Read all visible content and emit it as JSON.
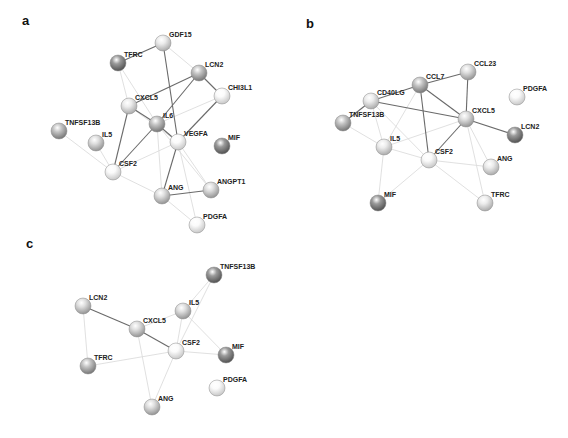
{
  "figure": {
    "panels": [
      {
        "label": "a",
        "label_pos": [
          22,
          25
        ],
        "nodes": [
          {
            "id": "GDF15",
            "x": 163,
            "y": 43,
            "shade": "light"
          },
          {
            "id": "TFRC",
            "x": 118,
            "y": 63,
            "shade": "dark"
          },
          {
            "id": "LCN2",
            "x": 199,
            "y": 73,
            "shade": "medium-dark"
          },
          {
            "id": "CHI3L1",
            "x": 222,
            "y": 96,
            "shade": "lighter"
          },
          {
            "id": "CXCL5",
            "x": 129,
            "y": 106,
            "shade": "light"
          },
          {
            "id": "IL6",
            "x": 157,
            "y": 124,
            "shade": "medium-dark"
          },
          {
            "id": "VEGFA",
            "x": 178,
            "y": 142,
            "shade": "lighter"
          },
          {
            "id": "TNFSF13B",
            "x": 59,
            "y": 131,
            "shade": "medium-dark"
          },
          {
            "id": "IL5",
            "x": 96,
            "y": 143,
            "shade": "medium"
          },
          {
            "id": "MIF",
            "x": 222,
            "y": 146,
            "shade": "dark"
          },
          {
            "id": "CSF2",
            "x": 113,
            "y": 172,
            "shade": "lighter"
          },
          {
            "id": "ANG",
            "x": 162,
            "y": 196,
            "shade": "medium"
          },
          {
            "id": "ANGPT1",
            "x": 211,
            "y": 190,
            "shade": "medium"
          },
          {
            "id": "PDGFA",
            "x": 197,
            "y": 225,
            "shade": "lighter"
          }
        ],
        "strong_edges": [
          [
            "TFRC",
            "GDF15"
          ],
          [
            "GDF15",
            "VEGFA"
          ],
          [
            "CXCL5",
            "LCN2"
          ],
          [
            "LCN2",
            "IL6"
          ],
          [
            "LCN2",
            "CHI3L1"
          ],
          [
            "CHI3L1",
            "VEGFA"
          ],
          [
            "CXCL5",
            "IL6"
          ],
          [
            "IL6",
            "VEGFA"
          ],
          [
            "CXCL5",
            "CSF2"
          ],
          [
            "IL6",
            "CSF2"
          ],
          [
            "VEGFA",
            "ANG"
          ],
          [
            "ANG",
            "ANGPT1"
          ]
        ],
        "faint_edges": [
          [
            "TFRC",
            "CXCL5"
          ],
          [
            "TFRC",
            "IL6"
          ],
          [
            "GDF15",
            "LCN2"
          ],
          [
            "TNFSF13B",
            "CSF2"
          ],
          [
            "IL5",
            "CSF2"
          ],
          [
            "CSF2",
            "VEGFA"
          ],
          [
            "CSF2",
            "ANG"
          ],
          [
            "VEGFA",
            "ANGPT1"
          ],
          [
            "VEGFA",
            "PDGFA"
          ],
          [
            "ANG",
            "PDGFA"
          ],
          [
            "IL6",
            "ANG"
          ],
          [
            "CXCL5",
            "VEGFA"
          ],
          [
            "IL6",
            "ANGPT1"
          ],
          [
            "CHI3L1",
            "IL6"
          ]
        ]
      },
      {
        "label": "b",
        "label_pos": [
          306,
          28
        ],
        "nodes": [
          {
            "id": "CCL23",
            "x": 468,
            "y": 72,
            "shade": "medium"
          },
          {
            "id": "CCL7",
            "x": 420,
            "y": 85,
            "shade": "medium-dark"
          },
          {
            "id": "CD40LG",
            "x": 371,
            "y": 101,
            "shade": "light"
          },
          {
            "id": "TNFSF13B",
            "x": 343,
            "y": 123,
            "shade": "medium-dark"
          },
          {
            "id": "CXCL5",
            "x": 466,
            "y": 119,
            "shade": "medium"
          },
          {
            "id": "PDGFA",
            "x": 517,
            "y": 97,
            "shade": "lighter"
          },
          {
            "id": "LCN2",
            "x": 515,
            "y": 135,
            "shade": "dark"
          },
          {
            "id": "IL5",
            "x": 384,
            "y": 147,
            "shade": "light"
          },
          {
            "id": "CSF2",
            "x": 429,
            "y": 160,
            "shade": "lighter"
          },
          {
            "id": "ANG",
            "x": 491,
            "y": 167,
            "shade": "light"
          },
          {
            "id": "MIF",
            "x": 378,
            "y": 203,
            "shade": "dark"
          },
          {
            "id": "TFRC",
            "x": 485,
            "y": 203,
            "shade": "light"
          }
        ],
        "strong_edges": [
          [
            "CD40LG",
            "CCL7"
          ],
          [
            "CCL7",
            "CCL23"
          ],
          [
            "CCL23",
            "CXCL5"
          ],
          [
            "CCL7",
            "CXCL5"
          ],
          [
            "CD40LG",
            "CXCL5"
          ],
          [
            "CD40LG",
            "TNFSF13B"
          ],
          [
            "CCL7",
            "CSF2"
          ],
          [
            "CXCL5",
            "CSF2"
          ],
          [
            "CXCL5",
            "LCN2"
          ]
        ],
        "faint_edges": [
          [
            "TNFSF13B",
            "IL5"
          ],
          [
            "IL5",
            "CSF2"
          ],
          [
            "IL5",
            "MIF"
          ],
          [
            "CSF2",
            "MIF"
          ],
          [
            "CSF2",
            "TFRC"
          ],
          [
            "CSF2",
            "ANG"
          ],
          [
            "CXCL5",
            "ANG"
          ],
          [
            "CXCL5",
            "TFRC"
          ],
          [
            "CD40LG",
            "IL5"
          ],
          [
            "CCL7",
            "IL5"
          ],
          [
            "CD40LG",
            "CSF2"
          ],
          [
            "IL5",
            "CXCL5"
          ]
        ]
      },
      {
        "label": "c",
        "label_pos": [
          26,
          248
        ],
        "nodes": [
          {
            "id": "TNFSF13B",
            "x": 214,
            "y": 275,
            "shade": "dark"
          },
          {
            "id": "LCN2",
            "x": 83,
            "y": 306,
            "shade": "medium"
          },
          {
            "id": "IL5",
            "x": 183,
            "y": 311,
            "shade": "medium"
          },
          {
            "id": "CXCL5",
            "x": 137,
            "y": 329,
            "shade": "medium"
          },
          {
            "id": "CSF2",
            "x": 176,
            "y": 351,
            "shade": "lighter"
          },
          {
            "id": "MIF",
            "x": 226,
            "y": 355,
            "shade": "dark"
          },
          {
            "id": "TFRC",
            "x": 88,
            "y": 366,
            "shade": "medium-dark"
          },
          {
            "id": "PDGFA",
            "x": 217,
            "y": 388,
            "shade": "lighter"
          },
          {
            "id": "ANG",
            "x": 152,
            "y": 407,
            "shade": "medium"
          }
        ],
        "strong_edges": [
          [
            "LCN2",
            "CXCL5"
          ],
          [
            "CXCL5",
            "CSF2"
          ]
        ],
        "faint_edges": [
          [
            "TNFSF13B",
            "IL5"
          ],
          [
            "TNFSF13B",
            "CSF2"
          ],
          [
            "IL5",
            "CSF2"
          ],
          [
            "IL5",
            "MIF"
          ],
          [
            "CSF2",
            "MIF"
          ],
          [
            "LCN2",
            "TFRC"
          ],
          [
            "TFRC",
            "CSF2"
          ],
          [
            "CXCL5",
            "ANG"
          ],
          [
            "CSF2",
            "ANG"
          ],
          [
            "CXCL5",
            "IL5"
          ]
        ]
      }
    ],
    "shade_colors": {
      "dark": [
        "#9a9a9a",
        "#4a4a4a"
      ],
      "medium-dark": [
        "#c4c4c4",
        "#6e6e6e"
      ],
      "medium": [
        "#dedede",
        "#8c8c8c"
      ],
      "light": [
        "#ececec",
        "#a4a4a4"
      ],
      "lighter": [
        "#fbfbfb",
        "#c2c2c2"
      ]
    }
  }
}
